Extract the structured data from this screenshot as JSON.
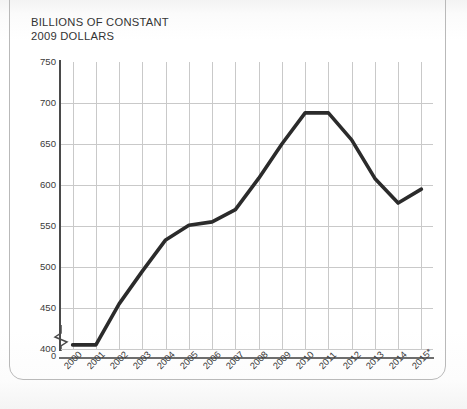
{
  "chart_data": {
    "type": "line",
    "title": "BILLIONS OF CONSTANT\n2009 DOLLARS",
    "xlabel": "",
    "ylabel": "",
    "categories": [
      "2000",
      "2001",
      "2002",
      "2003",
      "2004",
      "2005",
      "2006",
      "2007",
      "2008",
      "2009",
      "2010",
      "2011",
      "2012",
      "2013",
      "2014",
      "2015*"
    ],
    "values": [
      405,
      405,
      455,
      495,
      533,
      551,
      555,
      570,
      608,
      650,
      688,
      688,
      655,
      608,
      578,
      595
    ],
    "series": [
      {
        "name": "Constant 2009 dollars",
        "values": [
          405,
          405,
          455,
          495,
          533,
          551,
          555,
          570,
          608,
          650,
          688,
          688,
          655,
          608,
          578,
          595
        ]
      }
    ],
    "ylim": [
      400,
      750
    ],
    "yticks": [
      400,
      450,
      500,
      550,
      600,
      650,
      700,
      750
    ],
    "ytick_labels": [
      "400",
      "450",
      "500",
      "550",
      "600",
      "650",
      "700",
      "750"
    ],
    "y_axis_origin_label": "0",
    "y_axis_break": true,
    "grid": true,
    "legend": false,
    "legend_position": "none",
    "line_color": "#2b2b2b",
    "grid_color": "#c9c9c9",
    "axis_color": "#4a4a4a",
    "footnote_marker": "*"
  },
  "page": {
    "background_color": "#fdfdfd",
    "frame_color": "#b9b9b9"
  }
}
